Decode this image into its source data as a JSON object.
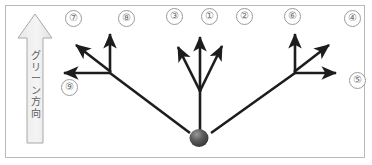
{
  "figure": {
    "type": "golf-green-break-direction-diagram",
    "background": "#ffffff",
    "border_color": "#b9b9b9",
    "width": 372,
    "height": 165
  },
  "green_arrow": {
    "label_text": "グリーン方向",
    "label_chars": [
      "グ",
      "リ",
      "ー",
      "ン",
      "方",
      "向"
    ],
    "orientation": "vertical-up",
    "fill": "#f0f0f0",
    "stroke": "#a8a8a8"
  },
  "ball": {
    "name": "golf-ball",
    "cx": 199,
    "cy": 138,
    "r": 9,
    "color": "#4a4a4a"
  },
  "markers": [
    {
      "label": "⑦",
      "x": 65,
      "y": 10
    },
    {
      "label": "⑧",
      "x": 118,
      "y": 10
    },
    {
      "label": "③",
      "x": 166,
      "y": 8
    },
    {
      "label": "①",
      "x": 201,
      "y": 8
    },
    {
      "label": "②",
      "x": 236,
      "y": 8
    },
    {
      "label": "⑥",
      "x": 284,
      "y": 8
    },
    {
      "label": "④",
      "x": 344,
      "y": 10
    },
    {
      "label": "⑨",
      "x": 61,
      "y": 79
    },
    {
      "label": "⑤",
      "x": 349,
      "y": 72
    }
  ],
  "vectors": {
    "stroke": "#1d1d1d",
    "left_cluster": {
      "vertex": [
        110,
        73
      ],
      "arrows": [
        {
          "name": "left-up-arrow",
          "to": [
            110,
            34
          ]
        },
        {
          "name": "left-diagonal-arrow",
          "to": [
            75,
            44
          ]
        },
        {
          "name": "left-horizontal-arrow",
          "to": [
            62,
            73
          ]
        }
      ],
      "tail_to_ball": [
        190,
        133
      ]
    },
    "center_cluster": {
      "vertex": [
        200,
        90
      ],
      "arrows": [
        {
          "name": "center-up-arrow",
          "to": [
            200,
            36
          ]
        },
        {
          "name": "center-left-arrow",
          "to": [
            177,
            46
          ]
        },
        {
          "name": "center-right-arrow",
          "to": [
            222,
            45
          ]
        }
      ],
      "tail_to_ball": [
        200,
        130
      ]
    },
    "right_cluster": {
      "vertex": [
        295,
        73
      ],
      "arrows": [
        {
          "name": "right-up-arrow",
          "to": [
            295,
            34
          ]
        },
        {
          "name": "right-diagonal-arrow",
          "to": [
            330,
            44
          ]
        },
        {
          "name": "right-horizontal-arrow",
          "to": [
            338,
            73
          ]
        }
      ],
      "tail_to_ball": [
        209,
        133
      ]
    }
  }
}
